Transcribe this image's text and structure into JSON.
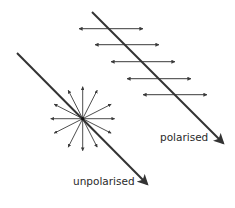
{
  "diagram": {
    "colors": {
      "ray": "#333333",
      "vector": "#3a3a3a",
      "label": "#2a2a2a",
      "background": "#ffffff"
    },
    "unpolarised": {
      "label": "unpolarised",
      "ray": {
        "x1": 17,
        "y1": 53,
        "x2": 147,
        "y2": 184
      },
      "star_center": {
        "x": 82.7,
        "y": 118.7
      },
      "star_radius": 32,
      "star_angles_deg": [
        0,
        27,
        63,
        90,
        117,
        153,
        180,
        207,
        243,
        270,
        297,
        333
      ]
    },
    "polarised": {
      "label": "polarised",
      "ray": {
        "x1": 92,
        "y1": 12,
        "x2": 223,
        "y2": 143
      },
      "vectors": [
        {
          "x1": 79,
          "x2": 143,
          "y": 28.7
        },
        {
          "x1": 95,
          "x2": 159,
          "y": 44.7
        },
        {
          "x1": 111,
          "x2": 175,
          "y": 61.7
        },
        {
          "x1": 127,
          "x2": 191,
          "y": 78.7
        },
        {
          "x1": 143,
          "x2": 207,
          "y": 94.7
        }
      ]
    }
  }
}
